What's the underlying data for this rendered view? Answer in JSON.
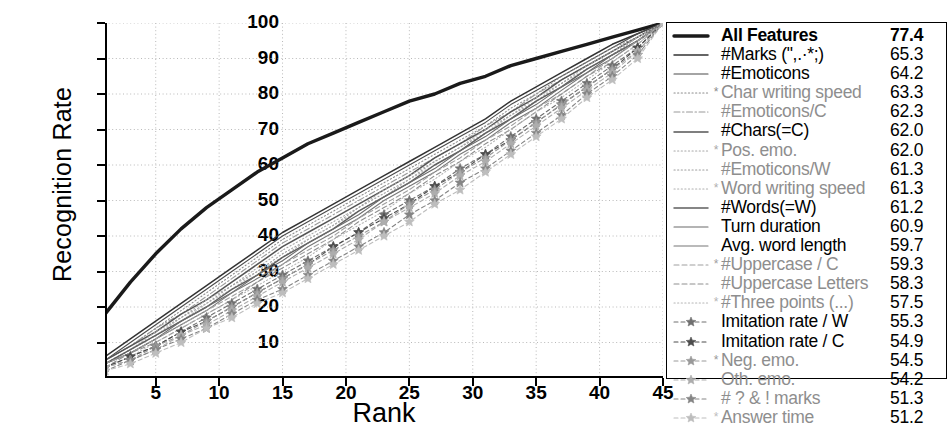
{
  "chart_data": {
    "type": "line",
    "title": "",
    "xlabel": "Rank",
    "ylabel": "Recognition Rate",
    "xlim": [
      1,
      45
    ],
    "ylim": [
      0,
      100
    ],
    "xticks": [
      5,
      10,
      15,
      20,
      25,
      30,
      35,
      40,
      45
    ],
    "yticks": [
      10,
      20,
      30,
      40,
      50,
      60,
      70,
      80,
      90,
      100
    ],
    "grid": true,
    "grid_style": "dotted",
    "legend_position": "right-outside",
    "x": [
      1,
      3,
      5,
      7,
      9,
      11,
      13,
      15,
      17,
      19,
      21,
      23,
      25,
      27,
      29,
      31,
      33,
      35,
      37,
      39,
      41,
      43,
      45
    ],
    "series": [
      {
        "name": "All Features",
        "value": 77.4,
        "style": "solid",
        "weight": "thick",
        "color": "#1a1a1a",
        "starred": false,
        "values": [
          18,
          27,
          35,
          42,
          48,
          53,
          58,
          62,
          66,
          69,
          72,
          75,
          78,
          80,
          83,
          85,
          88,
          90,
          92,
          94,
          96,
          98,
          100
        ]
      },
      {
        "name": "#Marks (\",.·*;)",
        "value": 65.3,
        "style": "solid",
        "weight": "medium",
        "color": "#333333",
        "starred": false,
        "values": [
          6,
          11,
          16,
          21,
          26,
          31,
          36,
          41,
          45,
          49,
          53,
          57,
          61,
          65,
          69,
          73,
          78,
          82,
          86,
          90,
          94,
          97,
          100
        ]
      },
      {
        "name": "#Emoticons",
        "value": 64.2,
        "style": "solid",
        "weight": "thin",
        "color": "#4a4a4a",
        "starred": false,
        "values": [
          5,
          10,
          15,
          20,
          25,
          30,
          35,
          40,
          44,
          48,
          52,
          56,
          60,
          64,
          68,
          72,
          77,
          81,
          85,
          89,
          93,
          97,
          100
        ]
      },
      {
        "name": "Char writing speed",
        "value": 63.3,
        "style": "dotted",
        "weight": "thin",
        "color": "#8c8c8c",
        "starred": true,
        "values": [
          5,
          9,
          14,
          19,
          24,
          29,
          34,
          39,
          43,
          47,
          51,
          55,
          59,
          63,
          67,
          71,
          76,
          80,
          85,
          89,
          93,
          96,
          100
        ]
      },
      {
        "name": "#Emoticons/C",
        "value": 62.3,
        "style": "dashdot",
        "weight": "thin",
        "color": "#9a9a9a",
        "starred": false,
        "values": [
          5,
          9,
          14,
          18,
          23,
          28,
          33,
          38,
          42,
          46,
          50,
          54,
          58,
          62,
          66,
          71,
          75,
          80,
          84,
          88,
          92,
          96,
          100
        ]
      },
      {
        "name": "#Chars(=C)",
        "value": 62.0,
        "style": "solid",
        "weight": "medium",
        "color": "#555555",
        "starred": false,
        "values": [
          5,
          9,
          13,
          18,
          22,
          27,
          32,
          37,
          41,
          45,
          49,
          53,
          57,
          62,
          66,
          70,
          75,
          79,
          84,
          88,
          92,
          96,
          100
        ]
      },
      {
        "name": "Pos. emo.",
        "value": 62.0,
        "style": "dotted",
        "weight": "thin",
        "color": "#a8a8a8",
        "starred": true,
        "values": [
          4,
          8,
          13,
          17,
          22,
          26,
          31,
          36,
          40,
          44,
          48,
          53,
          57,
          61,
          65,
          70,
          74,
          79,
          83,
          88,
          92,
          96,
          100
        ]
      },
      {
        "name": "#Emoticons/W",
        "value": 61.3,
        "style": "dotted",
        "weight": "thin",
        "color": "#9e9e9e",
        "starred": false,
        "values": [
          4,
          8,
          12,
          17,
          21,
          26,
          30,
          35,
          39,
          43,
          48,
          52,
          56,
          61,
          65,
          69,
          74,
          78,
          83,
          87,
          91,
          96,
          100
        ]
      },
      {
        "name": "Word writing speed",
        "value": 61.3,
        "style": "dotted",
        "weight": "thin",
        "color": "#b0b0b0",
        "starred": true,
        "values": [
          4,
          8,
          12,
          16,
          21,
          25,
          30,
          34,
          39,
          43,
          47,
          51,
          56,
          60,
          64,
          69,
          73,
          78,
          82,
          87,
          91,
          96,
          100
        ]
      },
      {
        "name": "#Words(=W)",
        "value": 61.2,
        "style": "solid",
        "weight": "medium",
        "color": "#5f5f5f",
        "starred": false,
        "values": [
          4,
          8,
          12,
          16,
          20,
          25,
          29,
          34,
          38,
          42,
          47,
          51,
          55,
          60,
          64,
          69,
          73,
          78,
          82,
          87,
          91,
          95,
          100
        ]
      },
      {
        "name": "Turn duration",
        "value": 60.9,
        "style": "solid",
        "weight": "thin",
        "color": "#6b6b6b",
        "starred": false,
        "values": [
          4,
          7,
          11,
          16,
          20,
          24,
          29,
          33,
          38,
          42,
          46,
          51,
          55,
          59,
          64,
          68,
          73,
          77,
          82,
          86,
          91,
          95,
          100
        ]
      },
      {
        "name": "Avg. word length",
        "value": 59.7,
        "style": "solid",
        "weight": "thin",
        "color": "#777777",
        "starred": false,
        "values": [
          4,
          7,
          11,
          15,
          19,
          24,
          28,
          32,
          37,
          41,
          45,
          50,
          54,
          58,
          63,
          67,
          72,
          76,
          81,
          86,
          90,
          95,
          100
        ]
      },
      {
        "name": "#Uppercase / C",
        "value": 59.3,
        "style": "dashed",
        "weight": "thin",
        "color": "#a0a0a0",
        "starred": true,
        "values": [
          4,
          7,
          11,
          15,
          19,
          23,
          27,
          32,
          36,
          40,
          45,
          49,
          53,
          58,
          62,
          67,
          71,
          76,
          80,
          85,
          90,
          95,
          100
        ]
      },
      {
        "name": "#Uppercase Letters",
        "value": 58.3,
        "style": "dashed",
        "weight": "thin",
        "color": "#8f8f8f",
        "starred": false,
        "values": [
          3,
          7,
          10,
          14,
          18,
          22,
          27,
          31,
          35,
          39,
          44,
          48,
          52,
          57,
          61,
          66,
          70,
          75,
          80,
          85,
          89,
          94,
          100
        ]
      },
      {
        "name": "#Three points (...)",
        "value": 57.5,
        "style": "dotted",
        "weight": "thin",
        "color": "#b5b5b5",
        "starred": true,
        "values": [
          3,
          6,
          10,
          14,
          18,
          22,
          26,
          30,
          34,
          39,
          43,
          47,
          52,
          56,
          61,
          65,
          70,
          75,
          79,
          84,
          89,
          94,
          100
        ]
      },
      {
        "name": "Imitation rate / W",
        "value": 55.3,
        "style": "star",
        "weight": "thin",
        "color": "#707070",
        "starred": false,
        "values": [
          3,
          6,
          9,
          13,
          17,
          21,
          25,
          29,
          33,
          37,
          41,
          46,
          50,
          54,
          59,
          63,
          68,
          73,
          78,
          83,
          88,
          93,
          100
        ]
      },
      {
        "name": "Imitation rate / C",
        "value": 54.9,
        "style": "star",
        "weight": "thin",
        "color": "#4d4d4d",
        "starred": false,
        "values": [
          3,
          6,
          9,
          13,
          16,
          20,
          24,
          28,
          32,
          37,
          41,
          45,
          49,
          54,
          58,
          63,
          67,
          72,
          77,
          82,
          87,
          93,
          100
        ]
      },
      {
        "name": "Neg. emo.",
        "value": 54.5,
        "style": "star",
        "weight": "thin",
        "color": "#999999",
        "starred": true,
        "values": [
          3,
          5,
          9,
          12,
          16,
          20,
          24,
          28,
          32,
          36,
          40,
          44,
          49,
          53,
          58,
          62,
          67,
          72,
          77,
          82,
          87,
          92,
          100
        ]
      },
      {
        "name": "Oth. emo.",
        "value": 54.2,
        "style": "star",
        "weight": "thin",
        "color": "#adadad",
        "starred": false,
        "values": [
          3,
          5,
          8,
          12,
          15,
          19,
          23,
          27,
          31,
          35,
          39,
          44,
          48,
          52,
          57,
          61,
          66,
          71,
          76,
          81,
          86,
          92,
          100
        ]
      },
      {
        "name": "# ? & ! marks",
        "value": 51.3,
        "style": "star",
        "weight": "thin",
        "color": "#858585",
        "starred": false,
        "values": [
          2,
          5,
          8,
          11,
          14,
          18,
          22,
          25,
          29,
          33,
          37,
          41,
          46,
          50,
          55,
          59,
          64,
          69,
          74,
          80,
          85,
          91,
          100
        ]
      },
      {
        "name": "Answer time",
        "value": 51.2,
        "style": "star",
        "weight": "thin",
        "color": "#bdbdbd",
        "starred": true,
        "values": [
          2,
          4,
          7,
          10,
          14,
          17,
          21,
          24,
          28,
          32,
          36,
          40,
          44,
          49,
          53,
          58,
          63,
          68,
          73,
          79,
          84,
          90,
          100
        ]
      }
    ]
  },
  "axes": {
    "ylabel": "Recognition Rate",
    "xlabel": "Rank",
    "yticks": [
      "100",
      "90",
      "80",
      "70",
      "60",
      "50",
      "40",
      "30",
      "20",
      "10"
    ],
    "xticks": [
      "5",
      "10",
      "15",
      "20",
      "25",
      "30",
      "35",
      "40",
      "45"
    ]
  }
}
